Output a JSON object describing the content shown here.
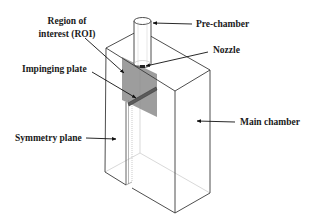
{
  "figure": {
    "type": "schematic"
  },
  "labels": {
    "roi_line1": "Region of",
    "roi_line2": "interest (ROI)",
    "impinging_plate": "Impinging plate",
    "symmetry_plane": "Symmetry plane",
    "pre_chamber": "Pre-chamber",
    "nozzle": "Nozzle",
    "main_chamber": "Main chamber"
  },
  "colors": {
    "roi_fill": "#8c8c8c",
    "plate_fill": "#5a5a5a",
    "edge": "#3a3a3a",
    "hidden_edge": "#c8c8c8",
    "text": "#1a1a1a"
  }
}
